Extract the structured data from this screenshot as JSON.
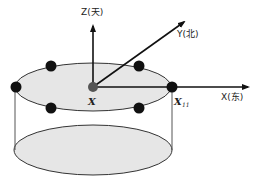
{
  "diagram": {
    "axes": {
      "z": {
        "label": "Z(天)"
      },
      "y": {
        "label": "Y(北)"
      },
      "x": {
        "label": "X(东)"
      }
    },
    "points": {
      "center_label": "X",
      "edge_label": "X",
      "edge_subscript": "11"
    },
    "colors": {
      "ellipse_fill": "#e6e6e6",
      "stroke": "#333333",
      "dot": "#111111",
      "center_dot": "#555555"
    }
  }
}
